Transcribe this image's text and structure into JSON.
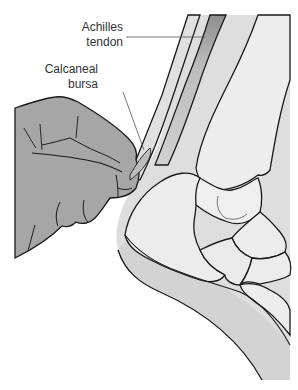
{
  "figure": {
    "labels": [
      {
        "id": "achilles",
        "line1": "Achilles",
        "line2": "tendon"
      },
      {
        "id": "bursa",
        "line1": "Calcaneal",
        "line2": "bursa"
      }
    ],
    "colors": {
      "hand": "#a6a6a6",
      "skin": "#d9d9d9",
      "bone": "#ececec",
      "tendon": "#c8c8c8",
      "tendon_shade": "#8e8e8e",
      "outline": "#1a1a1a",
      "leader": "#555555"
    }
  }
}
